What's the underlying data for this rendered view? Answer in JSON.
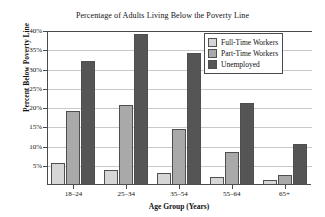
{
  "chart_data": {
    "type": "bar",
    "title": "Percentage of Adults Living Below the Poverty Line",
    "xlabel": "Age Group (Years)",
    "ylabel": "Percent Below Poverty Line",
    "categories": [
      "18–24",
      "25–34",
      "35–54",
      "55–64",
      "65+"
    ],
    "series": [
      {
        "name": "Full-Time Workers",
        "color": "#d6d6d6",
        "values": [
          5.6,
          4.0,
          3.2,
          2.0,
          1.3
        ]
      },
      {
        "name": "Part-Time Workers",
        "color": "#a9a9a9",
        "values": [
          19.3,
          20.8,
          14.5,
          8.6,
          2.5
        ]
      },
      {
        "name": "Unemployed",
        "color": "#555555",
        "values": [
          32.1,
          39.3,
          34.4,
          21.3,
          10.6
        ]
      }
    ],
    "ylim": [
      0,
      40
    ],
    "yticks": [
      5,
      10,
      15,
      20,
      25,
      30,
      35,
      40
    ],
    "ytick_labels": [
      "5%",
      "10%",
      "15%",
      "20%",
      "25%",
      "30%",
      "35%",
      "40%"
    ],
    "grid": true,
    "legend_position": "upper right"
  }
}
